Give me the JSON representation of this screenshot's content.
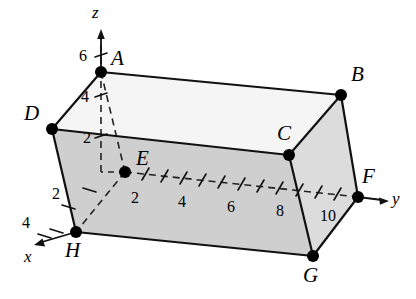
{
  "figure": {
    "type": "3d-coordinate-box-diagram",
    "colors": {
      "stroke": "#1a1a1a",
      "face_shaded": "#d2d2d2",
      "face_light": "#ededed",
      "face_top": "#f4f4f4",
      "background": "#ffffff",
      "vertex_dot": "#000000"
    },
    "axes": [
      {
        "name": "x",
        "label": "x",
        "label_x": 24,
        "label_y": 248,
        "direction": "down-left"
      },
      {
        "name": "y",
        "label": "y",
        "label_x": 392,
        "label_y": 190,
        "direction": "right"
      },
      {
        "name": "z",
        "label": "z",
        "label_x": 92,
        "label_y": 4,
        "direction": "up"
      }
    ],
    "axis_ticks": {
      "x": [
        {
          "value": "2",
          "x": 52,
          "y": 186
        },
        {
          "value": "4",
          "x": 22,
          "y": 215
        }
      ],
      "y": [
        {
          "value": "2",
          "x": 131,
          "y": 190
        },
        {
          "value": "4",
          "x": 178,
          "y": 194
        },
        {
          "value": "6",
          "x": 227,
          "y": 199
        },
        {
          "value": "8",
          "x": 276,
          "y": 203
        },
        {
          "value": "10",
          "x": 320,
          "y": 208
        }
      ],
      "z": [
        {
          "value": "2",
          "x": 83,
          "y": 130
        },
        {
          "value": "4",
          "x": 81,
          "y": 89
        },
        {
          "value": "6",
          "x": 79,
          "y": 48
        }
      ]
    },
    "vertices": [
      {
        "name": "A",
        "label": "A",
        "px": 101,
        "py": 72,
        "label_x": 111,
        "label_y": 48
      },
      {
        "name": "B",
        "label": "B",
        "px": 341,
        "py": 95,
        "label_x": 351,
        "label_y": 64
      },
      {
        "name": "C",
        "label": "C",
        "px": 289,
        "py": 155,
        "label_x": 277,
        "label_y": 123
      },
      {
        "name": "D",
        "label": "D",
        "px": 52,
        "py": 129,
        "label_x": 24,
        "label_y": 103
      },
      {
        "name": "E",
        "label": "E",
        "px": 125,
        "py": 172,
        "label_x": 136,
        "label_y": 148
      },
      {
        "name": "F",
        "label": "F",
        "px": 358,
        "py": 197,
        "label_x": 362,
        "label_y": 166
      },
      {
        "name": "G",
        "label": "G",
        "px": 313,
        "py": 256,
        "label_x": 303,
        "label_y": 265
      },
      {
        "name": "H",
        "label": "H",
        "px": 76,
        "py": 232,
        "label_x": 65,
        "label_y": 240
      }
    ]
  }
}
